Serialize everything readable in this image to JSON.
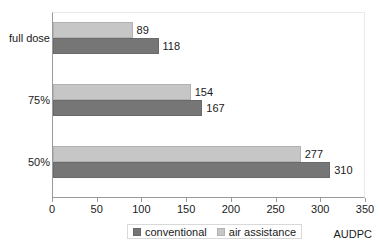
{
  "chart_data": {
    "type": "bar",
    "orientation": "horizontal",
    "title": "",
    "xlabel": "AUDPC",
    "ylabel": "",
    "xlim": [
      0,
      350
    ],
    "xticks": [
      0,
      50,
      100,
      150,
      200,
      250,
      300,
      350
    ],
    "grid": false,
    "legend_position": "bottom",
    "categories": [
      "full dose",
      "75%",
      "50%"
    ],
    "series": [
      {
        "name": "air assistance",
        "color": "#c6c6c6",
        "values": [
          89,
          154,
          277
        ]
      },
      {
        "name": "conventional",
        "color": "#767676",
        "values": [
          118,
          167,
          310
        ]
      }
    ]
  },
  "legend": {
    "items": [
      {
        "label": "conventional",
        "color": "#767676"
      },
      {
        "label": "air assistance",
        "color": "#c6c6c6"
      }
    ]
  },
  "axis": {
    "x_title": "AUDPC"
  }
}
